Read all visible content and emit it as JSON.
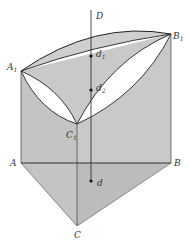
{
  "figure": {
    "type": "geometric-prism-diagram",
    "colors": {
      "face_fill": "#c8c8c8",
      "bottom_fill": "#bdbdbd",
      "lens_fill": "#ffffff",
      "line": "#222222"
    },
    "points": {
      "D": {
        "label": "D",
        "x": 91,
        "y": 10
      },
      "A1": {
        "label": "A",
        "sub": "1",
        "x": 21,
        "y": 71
      },
      "B1": {
        "label": "B",
        "sub": "1",
        "x": 171,
        "y": 34
      },
      "C1": {
        "label": "C",
        "sub": "1",
        "x": 77,
        "y": 124
      },
      "A": {
        "label": "A",
        "x": 21,
        "y": 163
      },
      "B": {
        "label": "B",
        "x": 171,
        "y": 163
      },
      "C": {
        "label": "C",
        "x": 77,
        "y": 226
      },
      "d1": {
        "label": "d",
        "sub": "1",
        "x": 91,
        "y": 56
      },
      "d2": {
        "label": "d",
        "sub": "2",
        "x": 91,
        "y": 90
      },
      "d": {
        "label": "d",
        "x": 91,
        "y": 181
      }
    }
  },
  "labels": {
    "D": "D",
    "A1": "A",
    "A1_sub": "1",
    "B1": "B",
    "B1_sub": "1",
    "C1": "C",
    "C1_sub": "1",
    "A": "A",
    "B": "B",
    "C": "C",
    "d1": "d",
    "d1_sub": "1",
    "d2": "d",
    "d2_sub": "2",
    "d": "d"
  }
}
